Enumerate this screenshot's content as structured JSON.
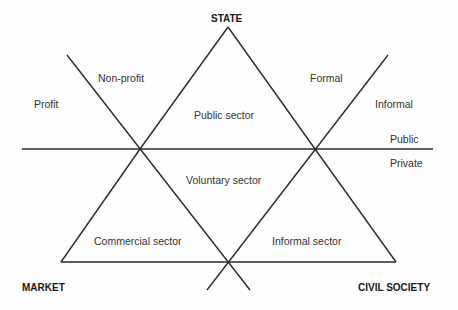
{
  "diagram": {
    "line_color": "#2a2a2a",
    "corners": {
      "top": "STATE",
      "bottom_left": "MARKET",
      "bottom_right": "CIVIL SOCIETY"
    },
    "sectors": {
      "public": "Public sector",
      "voluntary": "Voluntary sector",
      "commercial": "Commercial sector",
      "informal": "Informal sector"
    },
    "divides": {
      "profit": "Profit",
      "non_profit": "Non-profit",
      "formal": "Formal",
      "informal": "Informal",
      "public": "Public",
      "private": "Private"
    }
  }
}
